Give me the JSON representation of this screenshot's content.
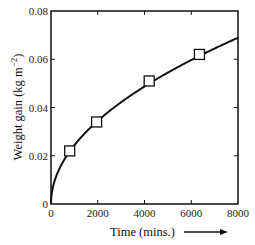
{
  "chart_data": {
    "type": "line",
    "title": "",
    "xlabel": "Time (mins.)",
    "ylabel": "Weight gain (kg m⁻²)",
    "xlim": [
      0,
      8000
    ],
    "ylim": [
      0,
      0.08
    ],
    "x_ticks": [
      0,
      2000,
      4000,
      6000,
      8000
    ],
    "x_tick_labels": [
      "0",
      "2000",
      "4000",
      "6000",
      "8000"
    ],
    "y_ticks": [
      0,
      0.02,
      0.04,
      0.06,
      0.08
    ],
    "y_tick_labels": [
      "0",
      "0.02",
      "0.04",
      "0.06",
      "0.08"
    ],
    "grid": false,
    "legend": null,
    "series": [
      {
        "name": "measured",
        "style": "open-square-markers",
        "x": [
          800,
          1950,
          4200,
          6350
        ],
        "y": [
          0.022,
          0.034,
          0.051,
          0.062
        ]
      },
      {
        "name": "parabolic fit",
        "style": "solid-line",
        "equation": "y = 0.00077 * sqrt(x)",
        "x": [
          0,
          100,
          400,
          800,
          1500,
          2000,
          3000,
          4000,
          5000,
          6000,
          7000,
          8000
        ],
        "y": [
          0,
          0.0077,
          0.0154,
          0.0218,
          0.0298,
          0.0344,
          0.0422,
          0.0487,
          0.0544,
          0.0596,
          0.0644,
          0.0689
        ]
      }
    ],
    "annotations": [
      "arrow pointing right after x-axis label"
    ]
  },
  "labels": {
    "xlabel": "Time (mins.)",
    "ylabel_main": "Weight gain (kg m",
    "ylabel_sup": "−2",
    "ylabel_close": ")"
  },
  "colors": {
    "axis": "#111111",
    "line": "#111111",
    "marker_fill": "#ffffff"
  }
}
